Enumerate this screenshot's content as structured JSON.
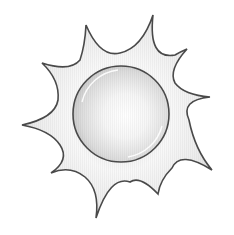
{
  "illustration": {
    "subject": "sun",
    "ray_count": 10,
    "colors": {
      "background": "#ffffff",
      "outline": "#4a4a4a",
      "ray_fill_light": "#f7f7f7",
      "ray_fill_dark": "#d6d6d6",
      "disc_center": "#ffffff",
      "disc_edge": "#c8c8c8",
      "highlight": "#ffffff"
    },
    "disc": {
      "cx": 121,
      "cy": 114,
      "r": 48
    }
  }
}
